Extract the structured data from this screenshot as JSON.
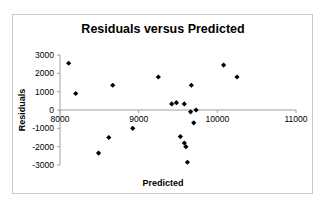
{
  "chart_data": {
    "type": "scatter",
    "title": "Residuals versus Predicted",
    "xlabel": "Predicted",
    "ylabel": "Residuals",
    "xlim": [
      8000,
      11000
    ],
    "ylim": [
      -3000,
      3000
    ],
    "x_ticks": [
      8000,
      9000,
      10000,
      11000
    ],
    "y_ticks": [
      3000,
      2000,
      1000,
      0,
      -1000,
      -2000,
      -3000
    ],
    "x_tick_labels": [
      "8000",
      "9000",
      "10000",
      "11000"
    ],
    "y_tick_labels": [
      "3000",
      "2000",
      "1000",
      "0",
      "-1000",
      "-2000",
      "-3000"
    ],
    "x_axis_crosses_y_at": 0,
    "grid": false,
    "legend": "none",
    "marker": "diamond",
    "marker_color": "#000000",
    "points": [
      {
        "x": 8110,
        "y": 2550
      },
      {
        "x": 8200,
        "y": 900
      },
      {
        "x": 8670,
        "y": 1350
      },
      {
        "x": 8490,
        "y": -2350
      },
      {
        "x": 8620,
        "y": -1500
      },
      {
        "x": 8925,
        "y": -1000
      },
      {
        "x": 9250,
        "y": 1800
      },
      {
        "x": 9420,
        "y": 330
      },
      {
        "x": 9480,
        "y": 400
      },
      {
        "x": 9530,
        "y": -1450
      },
      {
        "x": 9580,
        "y": 330
      },
      {
        "x": 9580,
        "y": -1800
      },
      {
        "x": 9600,
        "y": -2000
      },
      {
        "x": 9620,
        "y": -2850
      },
      {
        "x": 9660,
        "y": -100
      },
      {
        "x": 9670,
        "y": 1350
      },
      {
        "x": 9700,
        "y": -700
      },
      {
        "x": 9730,
        "y": 0
      },
      {
        "x": 10080,
        "y": 2450
      },
      {
        "x": 10250,
        "y": 1800
      }
    ]
  }
}
